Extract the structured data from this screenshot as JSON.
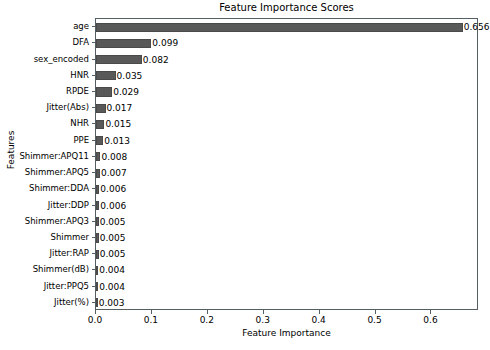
{
  "chart_data": {
    "type": "bar",
    "orientation": "horizontal",
    "title": "Feature Importance Scores",
    "xlabel": "Feature Importance",
    "ylabel": "Features",
    "grid": false,
    "legend": null,
    "xlim": [
      0.0,
      0.685
    ],
    "xticks": [
      "0.0",
      "0.1",
      "0.2",
      "0.3",
      "0.4",
      "0.5",
      "0.6"
    ],
    "xtick_values": [
      0.0,
      0.1,
      0.2,
      0.3,
      0.4,
      0.5,
      0.6
    ],
    "bar_color": "#595959",
    "categories": [
      "age",
      "DFA",
      "sex_encoded",
      "HNR",
      "RPDE",
      "Jitter(Abs)",
      "NHR",
      "PPE",
      "Shimmer:APQ11",
      "Shimmer:APQ5",
      "Shimmer:DDA",
      "Jitter:DDP",
      "Shimmer:APQ3",
      "Shimmer",
      "Jitter:RAP",
      "Shimmer(dB)",
      "Jitter:PPQ5",
      "Jitter(%)"
    ],
    "values": [
      0.656,
      0.099,
      0.082,
      0.035,
      0.029,
      0.017,
      0.015,
      0.013,
      0.008,
      0.007,
      0.006,
      0.006,
      0.005,
      0.005,
      0.005,
      0.004,
      0.004,
      0.003
    ],
    "value_labels": [
      "0.656",
      "0.099",
      "0.082",
      "0.035",
      "0.029",
      "0.017",
      "0.015",
      "0.013",
      "0.008",
      "0.007",
      "0.006",
      "0.006",
      "0.005",
      "0.005",
      "0.005",
      "0.004",
      "0.004",
      "0.003"
    ]
  }
}
